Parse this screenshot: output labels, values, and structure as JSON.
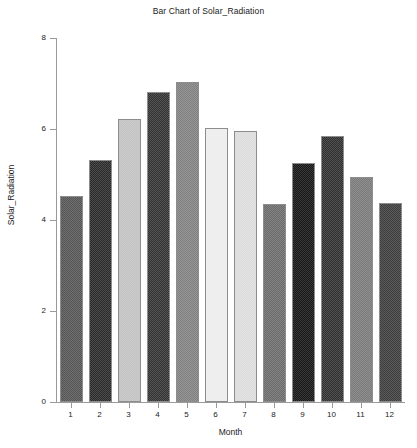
{
  "chart_data": {
    "type": "bar",
    "title": "Bar Chart of Solar_Radiation",
    "xlabel": "Month",
    "ylabel": "Solar_Radiation",
    "categories": [
      "1",
      "2",
      "3",
      "4",
      "5",
      "6",
      "7",
      "8",
      "9",
      "10",
      "11",
      "12"
    ],
    "values": [
      4.53,
      5.33,
      6.22,
      6.81,
      7.03,
      6.03,
      5.95,
      4.35,
      5.25,
      5.85,
      4.95,
      4.37
    ],
    "ylim": [
      0,
      8
    ],
    "yticks": [
      0,
      2,
      4,
      6,
      8
    ],
    "ytick_labels": [
      "0",
      "2",
      "4",
      "6",
      "8"
    ],
    "xtick_labels": [
      "1",
      "2",
      "3",
      "4",
      "5",
      "6",
      "7",
      "8",
      "9",
      "10",
      "11",
      "12"
    ],
    "grid": false,
    "legend": "none",
    "bar_colors": [
      "#555555",
      "#2a2a2a",
      "#c2c2c2",
      "#333333",
      "#818181",
      "#ededed",
      "#dcdcdc",
      "#6b6b6b",
      "#161616",
      "#303030",
      "#7a7a7a",
      "#3d3d3d"
    ],
    "bar_edge_color": "#8d8d8d",
    "axis_color": "#9a9a9a",
    "text_color": "#1a1a1a",
    "background": "#ffffff"
  }
}
